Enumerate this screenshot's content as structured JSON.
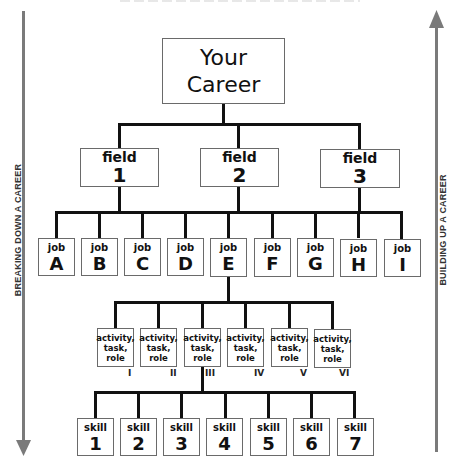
{
  "root": {
    "line1": "Your",
    "line2": "Career"
  },
  "fields": [
    {
      "label": "field",
      "num": "1"
    },
    {
      "label": "field",
      "num": "2"
    },
    {
      "label": "field",
      "num": "3"
    }
  ],
  "jobs": [
    {
      "label": "job",
      "num": "A"
    },
    {
      "label": "job",
      "num": "B"
    },
    {
      "label": "job",
      "num": "C"
    },
    {
      "label": "job",
      "num": "D"
    },
    {
      "label": "job",
      "num": "E"
    },
    {
      "label": "job",
      "num": "F"
    },
    {
      "label": "job",
      "num": "G"
    },
    {
      "label": "job",
      "num": "H"
    },
    {
      "label": "job",
      "num": "I"
    }
  ],
  "activities": [
    {
      "line1": "activity,",
      "line2": "task,",
      "line3": "role",
      "numeral": "I"
    },
    {
      "line1": "activity,",
      "line2": "task,",
      "line3": "role",
      "numeral": "II"
    },
    {
      "line1": "activity,",
      "line2": "task,",
      "line3": "role",
      "numeral": "III"
    },
    {
      "line1": "activity,",
      "line2": "task,",
      "line3": "role",
      "numeral": "IV"
    },
    {
      "line1": "activity,",
      "line2": "task,",
      "line3": "role",
      "numeral": "V"
    },
    {
      "line1": "activity,",
      "line2": "task,",
      "line3": "role",
      "numeral": "VI"
    }
  ],
  "skills": [
    {
      "label": "skill",
      "num": "1"
    },
    {
      "label": "skill",
      "num": "2"
    },
    {
      "label": "skill",
      "num": "3"
    },
    {
      "label": "skill",
      "num": "4"
    },
    {
      "label": "skill",
      "num": "5"
    },
    {
      "label": "skill",
      "num": "6"
    },
    {
      "label": "skill",
      "num": "7"
    }
  ],
  "side_labels": {
    "left": "BREAKING DOWN A CAREER",
    "right": "BUILDING UP A CAREER"
  },
  "colors": {
    "line": "#111111",
    "arrow": "#7a7a7a",
    "box_border": "#6a6a6a"
  }
}
